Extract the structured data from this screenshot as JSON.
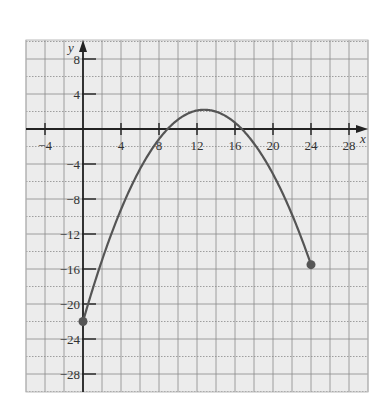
{
  "chart_data": {
    "type": "line",
    "title": "",
    "xlabel": "x",
    "ylabel": "y",
    "xlim": [
      -6,
      30
    ],
    "ylim": [
      -30,
      10
    ],
    "grid": true,
    "grid_step": 2,
    "x_ticks": [
      -4,
      4,
      8,
      12,
      16,
      20,
      24,
      28
    ],
    "y_ticks": [
      8,
      4,
      -4,
      -8,
      -12,
      -16,
      -20,
      -24,
      -28
    ],
    "series": [
      {
        "name": "parabola",
        "description": "Downward-opening parabola on closed domain [0, 24]",
        "vertex": [
          12.75,
          2.2
        ],
        "x_intercepts": [
          7.7,
          17.5
        ],
        "endpoints": [
          [
            0,
            -22
          ],
          [
            24,
            -15.5
          ]
        ],
        "x": [
          0,
          2,
          4,
          6,
          8,
          10,
          12,
          12.75,
          14,
          16,
          18,
          20,
          22,
          24
        ],
        "y": [
          -22,
          -15.4,
          -9.6,
          -4.6,
          -0.6,
          1.6,
          2.1,
          2.2,
          2.0,
          0.7,
          -1.9,
          -5.6,
          -10.4,
          -15.5
        ]
      }
    ],
    "legend": null
  },
  "labels": {
    "x_axis": "x",
    "y_axis": "y"
  },
  "colors": {
    "grid": "#9a9a9a",
    "axis": "#222222",
    "curve": "#555555",
    "background": "#ececec"
  }
}
